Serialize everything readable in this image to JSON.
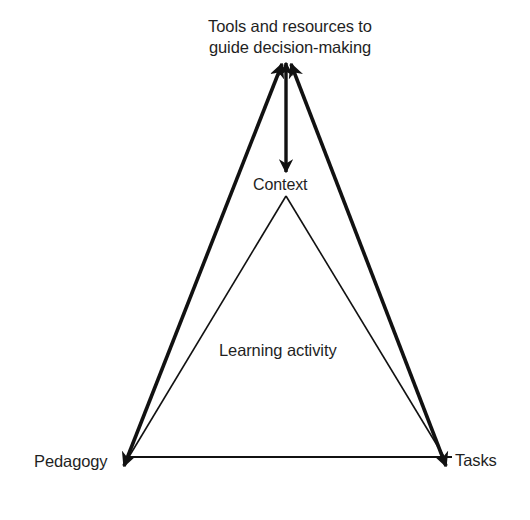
{
  "diagram": {
    "type": "conceptual triangle model",
    "nodes": {
      "top": {
        "line1": "Tools and resources to",
        "line2": "guide decision-making"
      },
      "context": "Context",
      "center": "Learning activity",
      "bottom_left": "Pedagogy",
      "bottom_right": "Tasks"
    },
    "edges": [
      {
        "from": "Tools and resources to guide decision-making",
        "to": "Pedagogy",
        "style": "thick",
        "direction": "bidirectional"
      },
      {
        "from": "Tools and resources to guide decision-making",
        "to": "Tasks",
        "style": "thick",
        "direction": "bidirectional"
      },
      {
        "from": "Tools and resources to guide decision-making",
        "to": "Context",
        "style": "thick",
        "direction": "bidirectional"
      },
      {
        "from": "Context",
        "to": "Pedagogy",
        "style": "thin",
        "direction": "none"
      },
      {
        "from": "Context",
        "to": "Tasks",
        "style": "thin",
        "direction": "none"
      },
      {
        "from": "Pedagogy",
        "to": "Tasks",
        "style": "thin",
        "direction": "none"
      }
    ],
    "colors": {
      "line": "#111111",
      "text": "#1f1f1f",
      "background": "#ffffff"
    }
  }
}
